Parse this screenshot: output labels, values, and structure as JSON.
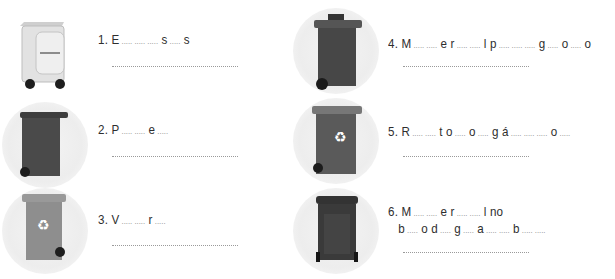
{
  "worksheet": {
    "items": [
      {
        "number": "1.",
        "parts": [
          "E",
          " ..... ..... .....",
          "s",
          " .....",
          "s"
        ],
        "bin": "white-bin-with-label",
        "bin_color": "#dcdcdc"
      },
      {
        "number": "2.",
        "parts": [
          "P",
          " ..... .....",
          "e",
          " ....."
        ],
        "bin": "dark-bin",
        "bin_color": "#4a4a4a"
      },
      {
        "number": "3.",
        "parts": [
          "V",
          " ..... .....",
          "r",
          " ....."
        ],
        "bin": "grey-recycling-bin",
        "bin_color": "#8e8e8e"
      },
      {
        "number": "4.",
        "parts": [
          "M",
          " ..... .....",
          "e r",
          " ..... .....",
          "l  p",
          " ..... ..... .....",
          "g",
          " .....",
          "o",
          " .....",
          "o"
        ],
        "bin": "dark-bin-with-lid",
        "bin_color": "#474747"
      },
      {
        "number": "5.",
        "parts": [
          "R",
          " ..... .....",
          "t o",
          " .....",
          "  o",
          " .....",
          "g á",
          " ..... ..... .....",
          "o",
          " ....."
        ],
        "bin": "dark-recycling-bin",
        "bin_color": "#5a5a5a"
      },
      {
        "number": "6.",
        "parts": [
          "M",
          " ..... .....",
          "e r",
          " ..... .....",
          "l no"
        ],
        "parts_line2": [
          "b",
          " .....",
          "o d",
          " .....",
          "g",
          " .....",
          "a",
          " ..... .....",
          "b",
          " ..... ....."
        ],
        "bin": "black-bin",
        "bin_color": "#3a3a3a"
      }
    ]
  }
}
